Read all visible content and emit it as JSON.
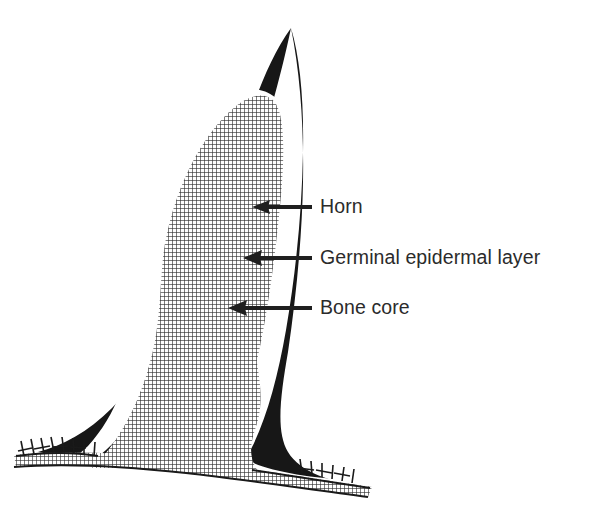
{
  "figure": {
    "kind": "anatomical-cross-section",
    "background_color": "#ffffff",
    "ink_color": "#1a1a1a",
    "regions": [
      {
        "id": "horn-sheath",
        "name": "Horn",
        "fill_style": "solid-black",
        "color": "#171717",
        "description": "Outer keratin horn sheath, solid black, forms the pointed outline of the horn"
      },
      {
        "id": "germinal-epidermal-layer",
        "name": "Germinal epidermal layer",
        "fill_style": "solid-white",
        "color": "#ffffff",
        "description": "Thin white band separating the horn sheath from the bone core"
      },
      {
        "id": "bone-core",
        "name": "Bone core",
        "fill_style": "cross-hatch-grid",
        "color": "#3a3a3a",
        "description": "Cross-hatched bony core continuous with the skull bone at the base"
      },
      {
        "id": "skull-bone",
        "name": "Skull bone",
        "fill_style": "cross-hatch-grid",
        "color": "#3a3a3a",
        "description": "Cross-hatched skull band running along the bottom of the figure"
      },
      {
        "id": "hair-bristles",
        "name": "Hair bristles",
        "fill_style": "stroke-ticks",
        "color": "#1a1a1a",
        "description": "Short tick marks on the skin line at the left and right of the horn base"
      }
    ],
    "callouts": [
      {
        "id": "horn",
        "label": "Horn",
        "target_region": "horn-sheath",
        "arrow_head": true,
        "arrow_y": 207,
        "arrow_tip_x": 252,
        "arrow_tail_x": 312,
        "label_x": 320
      },
      {
        "id": "germinal-epidermal-layer",
        "label": "Germinal epidermal layer",
        "target_region": "germinal-epidermal-layer",
        "arrow_head": true,
        "arrow_y": 258,
        "arrow_tip_x": 243,
        "arrow_tail_x": 312,
        "label_x": 320
      },
      {
        "id": "bone-core",
        "label": "Bone core",
        "target_region": "bone-core",
        "arrow_head": true,
        "arrow_y": 308,
        "arrow_tip_x": 228,
        "arrow_tail_x": 312,
        "label_x": 320
      }
    ]
  }
}
